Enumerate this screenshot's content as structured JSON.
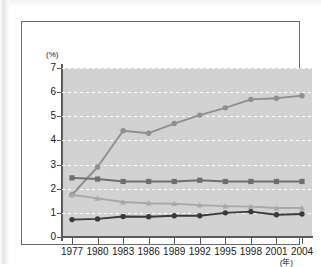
{
  "chart_data": {
    "type": "line",
    "title": "",
    "xlabel": "(年)",
    "ylabel": "(%)",
    "categories": [
      "1977",
      "1980",
      "1983",
      "1986",
      "1989",
      "1992",
      "1995",
      "1998",
      "2001",
      "2004"
    ],
    "x": [
      1977,
      1980,
      1983,
      1986,
      1989,
      1992,
      1995,
      1998,
      2001,
      2004
    ],
    "ylim": [
      0,
      7
    ],
    "xlim": [
      1977,
      2004
    ],
    "yticks": [
      "0",
      "1",
      "2",
      "3",
      "4",
      "5",
      "6",
      "7"
    ],
    "ytick_values": [
      0,
      1,
      2,
      3,
      4,
      5,
      6,
      7
    ],
    "grid": "horizontal-dotted-white",
    "legend": "none",
    "plot_background": "#d2d2d2",
    "series": [
      {
        "name": "rising-series",
        "color": "#8f8f8f",
        "marker": "circle",
        "values": [
          1.75,
          2.9,
          4.4,
          4.3,
          4.7,
          5.05,
          5.35,
          5.7,
          5.75,
          5.85
        ]
      },
      {
        "name": "flat-upper-series",
        "color": "#6e6e6e",
        "marker": "square",
        "values": [
          2.45,
          2.4,
          2.3,
          2.3,
          2.3,
          2.35,
          2.3,
          2.3,
          2.3,
          2.3
        ]
      },
      {
        "name": "declining-series",
        "color": "#a8a8a8",
        "marker": "triangle",
        "values": [
          1.75,
          1.6,
          1.45,
          1.4,
          1.38,
          1.32,
          1.28,
          1.26,
          1.2,
          1.2
        ]
      },
      {
        "name": "flat-lower-series",
        "color": "#3a3a3a",
        "marker": "circle",
        "values": [
          0.72,
          0.75,
          0.85,
          0.84,
          0.88,
          0.88,
          1.0,
          1.05,
          0.92,
          0.95
        ]
      }
    ]
  }
}
